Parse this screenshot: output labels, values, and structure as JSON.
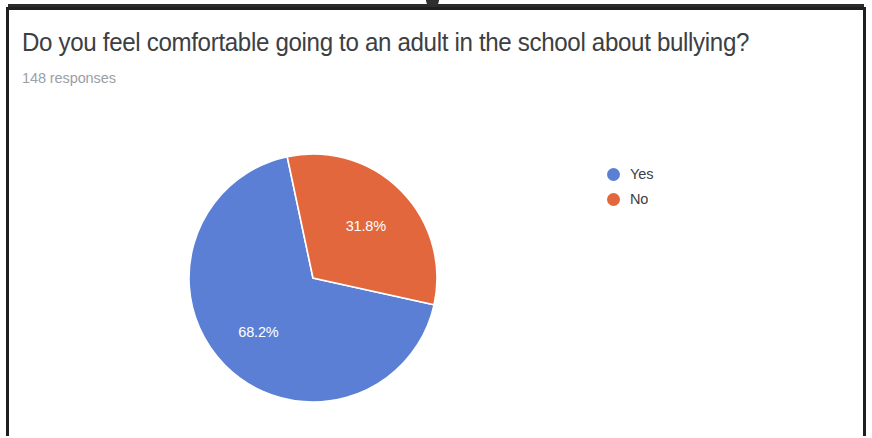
{
  "card": {
    "title": "Do you feel comfortable going to an adult in the school about bullying?",
    "response_count": "148 responses"
  },
  "legend": {
    "items": [
      {
        "label": "Yes",
        "color": "#5c7fd6"
      },
      {
        "label": "No",
        "color": "#e2673c"
      }
    ]
  },
  "slices": [
    {
      "label": "68.2%"
    },
    {
      "label": "31.8%"
    }
  ],
  "chart_data": {
    "type": "pie",
    "title": "Do you feel comfortable going to an adult in the school about bullying?",
    "subtitle": "148 responses",
    "total_responses": 148,
    "categories": [
      "Yes",
      "No"
    ],
    "values": [
      68.2,
      31.8
    ],
    "value_unit": "percent",
    "counts": [
      101,
      47
    ],
    "data_labels": [
      "68.2%",
      "31.8%"
    ],
    "colors": [
      "#5c7fd6",
      "#e2673c"
    ],
    "legend_position": "right",
    "grid": false,
    "start_angle_deg": -12,
    "direction": "clockwise"
  }
}
